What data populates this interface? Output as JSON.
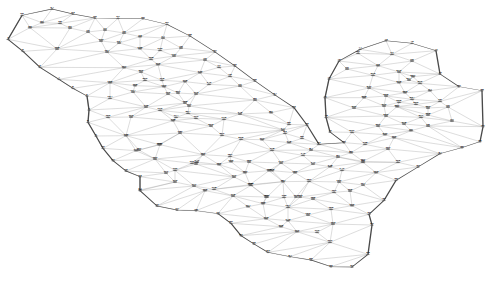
{
  "figure": {
    "name": "finite-element-mesh",
    "type": "triangulated-mesh-diagram",
    "title": "",
    "width": 492,
    "height": 282,
    "background_color": "#ffffff",
    "edge_color": "#8c8c8c",
    "boundary_color": "#4a4a4a",
    "node_color": "#6b6b6b",
    "label_color": "#1a1a1a",
    "node_count": 231
  },
  "chart_data": {
    "type": "scatter",
    "title": "",
    "xlabel": "",
    "ylabel": "",
    "grid": false,
    "legend": false,
    "xlim": [
      0,
      492
    ],
    "ylim": [
      0,
      282
    ]
  },
  "nodes": [
    {
      "id": "1",
      "x": 8,
      "y": 118,
      "b": 1
    },
    {
      "id": "2",
      "x": 23,
      "y": 154,
      "b": 1
    },
    {
      "id": "3",
      "x": 40,
      "y": 202,
      "b": 1
    },
    {
      "id": "4",
      "x": 59,
      "y": 238,
      "b": 1
    },
    {
      "id": "5",
      "x": 73,
      "y": 265,
      "b": 1
    },
    {
      "id": "6",
      "x": 87,
      "y": 288,
      "b": 1
    },
    {
      "id": "7",
      "x": 89,
      "y": 330,
      "b": 1
    },
    {
      "id": "8",
      "x": 88,
      "y": 367,
      "b": 1
    },
    {
      "id": "9",
      "x": 96,
      "y": 408,
      "b": 1
    },
    {
      "id": "10",
      "x": 103,
      "y": 445,
      "b": 1
    },
    {
      "id": "11",
      "x": 113,
      "y": 482,
      "b": 1
    },
    {
      "id": "12",
      "x": 126,
      "y": 513,
      "b": 1
    },
    {
      "id": "13",
      "x": 140,
      "y": 530,
      "b": 1
    },
    {
      "id": "14",
      "x": 140,
      "y": 570,
      "b": 1
    },
    {
      "id": "15",
      "x": 140,
      "y": 572,
      "b": 1
    },
    {
      "id": "16",
      "x": 157,
      "y": 618,
      "b": 1
    },
    {
      "id": "17",
      "x": 177,
      "y": 630,
      "b": 1
    },
    {
      "id": "18",
      "x": 196,
      "y": 632,
      "b": 1
    },
    {
      "id": "19",
      "x": 218,
      "y": 641,
      "b": 1
    },
    {
      "id": "20",
      "x": 231,
      "y": 670,
      "b": 1
    },
    {
      "id": "21",
      "x": 241,
      "y": 707,
      "b": 1
    },
    {
      "id": "22",
      "x": 254,
      "y": 732,
      "b": 1
    },
    {
      "id": "23",
      "x": 268,
      "y": 757,
      "b": 1
    },
    {
      "id": "24",
      "x": 290,
      "y": 770,
      "b": 1
    },
    {
      "id": "25",
      "x": 311,
      "y": 780,
      "b": 1
    },
    {
      "id": "26",
      "x": 331,
      "y": 800,
      "b": 1
    },
    {
      "id": "27",
      "x": 352,
      "y": 801,
      "b": 1
    },
    {
      "id": "28",
      "x": 368,
      "y": 763,
      "b": 1
    },
    {
      "id": "29",
      "x": 372,
      "y": 675,
      "b": 1
    },
    {
      "id": "30",
      "x": 369,
      "y": 643,
      "b": 1
    },
    {
      "id": "31",
      "x": 384,
      "y": 601,
      "b": 1
    },
    {
      "id": "32",
      "x": 396,
      "y": 541,
      "b": 1
    },
    {
      "id": "33",
      "x": 418,
      "y": 501,
      "b": 1
    },
    {
      "id": "34",
      "x": 440,
      "y": 461,
      "b": 1
    },
    {
      "id": "35",
      "x": 462,
      "y": 443,
      "b": 1
    },
    {
      "id": "36",
      "x": 480,
      "y": 425,
      "b": 1
    },
    {
      "id": "37",
      "x": 483,
      "y": 380,
      "b": 1
    },
    {
      "id": "38",
      "x": 482,
      "y": 272,
      "b": 1
    },
    {
      "id": "39",
      "x": 459,
      "y": 260,
      "b": 1
    },
    {
      "id": "40",
      "x": 440,
      "y": 222,
      "b": 1
    },
    {
      "id": "41",
      "x": 436,
      "y": 152,
      "b": 1
    },
    {
      "id": "42",
      "x": 412,
      "y": 130,
      "b": 1
    },
    {
      "id": "43",
      "x": 386,
      "y": 122,
      "b": 1
    },
    {
      "id": "44",
      "x": 360,
      "y": 148,
      "b": 1
    },
    {
      "id": "45",
      "x": 339,
      "y": 183,
      "b": 1
    },
    {
      "id": "46",
      "x": 329,
      "y": 237,
      "b": 1
    },
    {
      "id": "47",
      "x": 325,
      "y": 293,
      "b": 1
    },
    {
      "id": "48",
      "x": 326,
      "y": 352,
      "b": 1
    },
    {
      "id": "49",
      "x": 330,
      "y": 396,
      "b": 1
    },
    {
      "id": "50",
      "x": 344,
      "y": 428,
      "b": 1
    },
    {
      "id": "51",
      "x": 319,
      "y": 433,
      "b": 0
    },
    {
      "id": "52",
      "x": 307,
      "y": 375,
      "b": 1
    },
    {
      "id": "53",
      "x": 294,
      "y": 323,
      "b": 1
    },
    {
      "id": "54",
      "x": 275,
      "y": 285,
      "b": 1
    },
    {
      "id": "55",
      "x": 255,
      "y": 243,
      "b": 1
    },
    {
      "id": "56",
      "x": 235,
      "y": 198,
      "b": 1
    },
    {
      "id": "57",
      "x": 215,
      "y": 156,
      "b": 1
    },
    {
      "id": "58",
      "x": 190,
      "y": 108,
      "b": 1
    },
    {
      "id": "59",
      "x": 167,
      "y": 73,
      "b": 1
    },
    {
      "id": "60",
      "x": 143,
      "y": 56,
      "b": 1
    },
    {
      "id": "61",
      "x": 118,
      "y": 55,
      "b": 1
    },
    {
      "id": "62",
      "x": 95,
      "y": 54,
      "b": 1
    },
    {
      "id": "63",
      "x": 73,
      "y": 42,
      "b": 1
    },
    {
      "id": "64",
      "x": 52,
      "y": 27,
      "b": 1
    },
    {
      "id": "65",
      "x": 22,
      "y": 46,
      "b": 1
    },
    {
      "id": "66",
      "x": 30,
      "y": 83,
      "b": 0
    },
    {
      "id": "67",
      "x": 42,
      "y": 68,
      "b": 0
    },
    {
      "id": "68",
      "x": 60,
      "y": 70,
      "b": 0
    },
    {
      "id": "69",
      "x": 70,
      "y": 84,
      "b": 0
    },
    {
      "id": "70",
      "x": 88,
      "y": 96,
      "b": 0
    },
    {
      "id": "71",
      "x": 105,
      "y": 90,
      "b": 0
    },
    {
      "id": "72",
      "x": 124,
      "y": 99,
      "b": 0
    },
    {
      "id": "73",
      "x": 140,
      "y": 110,
      "b": 0
    },
    {
      "id": "74",
      "x": 163,
      "y": 114,
      "b": 0
    },
    {
      "id": "75",
      "x": 181,
      "y": 144,
      "b": 0
    },
    {
      "id": "76",
      "x": 205,
      "y": 180,
      "b": 0
    },
    {
      "id": "77",
      "x": 219,
      "y": 202,
      "b": 0
    },
    {
      "id": "78",
      "x": 230,
      "y": 229,
      "b": 0
    },
    {
      "id": "79",
      "x": 240,
      "y": 258,
      "b": 0
    },
    {
      "id": "80",
      "x": 255,
      "y": 300,
      "b": 0
    },
    {
      "id": "81",
      "x": 271,
      "y": 338,
      "b": 0
    },
    {
      "id": "82",
      "x": 289,
      "y": 373,
      "b": 0
    },
    {
      "id": "83",
      "x": 285,
      "y": 400,
      "b": 0
    },
    {
      "id": "84",
      "x": 311,
      "y": 450,
      "b": 0
    },
    {
      "id": "85",
      "x": 302,
      "y": 415,
      "b": 0
    },
    {
      "id": "86",
      "x": 351,
      "y": 458,
      "b": 0
    },
    {
      "id": "87",
      "x": 338,
      "y": 471,
      "b": 0
    },
    {
      "id": "88",
      "x": 363,
      "y": 487,
      "b": 0
    },
    {
      "id": "89",
      "x": 358,
      "y": 160,
      "b": 0
    },
    {
      "id": "90",
      "x": 347,
      "y": 207,
      "b": 0
    },
    {
      "id": "91",
      "x": 392,
      "y": 163,
      "b": 0
    },
    {
      "id": "92",
      "x": 412,
      "y": 183,
      "b": 0
    },
    {
      "id": "93",
      "x": 378,
      "y": 197,
      "b": 0
    },
    {
      "id": "94",
      "x": 430,
      "y": 272,
      "b": 0
    },
    {
      "id": "95",
      "x": 440,
      "y": 304,
      "b": 0
    },
    {
      "id": "96",
      "x": 448,
      "y": 321,
      "b": 0
    },
    {
      "id": "97",
      "x": 452,
      "y": 363,
      "b": 0
    },
    {
      "id": "98",
      "x": 428,
      "y": 378,
      "b": 0
    },
    {
      "id": "99",
      "x": 411,
      "y": 392,
      "b": 0
    },
    {
      "id": "100",
      "x": 394,
      "y": 413,
      "b": 0
    },
    {
      "id": "101",
      "x": 388,
      "y": 447,
      "b": 0
    },
    {
      "id": "102",
      "x": 398,
      "y": 487,
      "b": 0
    },
    {
      "id": "103",
      "x": 376,
      "y": 518,
      "b": 0
    },
    {
      "id": "104",
      "x": 363,
      "y": 555,
      "b": 0
    },
    {
      "id": "105",
      "x": 350,
      "y": 573,
      "b": 0
    },
    {
      "id": "106",
      "x": 352,
      "y": 617,
      "b": 0
    },
    {
      "id": "107",
      "x": 363,
      "y": 484,
      "b": 0
    },
    {
      "id": "108",
      "x": 365,
      "y": 433,
      "b": 0
    },
    {
      "id": "109",
      "x": 330,
      "y": 727,
      "b": 0
    },
    {
      "id": "110",
      "x": 317,
      "y": 697,
      "b": 0
    },
    {
      "id": "111",
      "x": 297,
      "y": 695,
      "b": 0
    },
    {
      "id": "112",
      "x": 281,
      "y": 680,
      "b": 0
    },
    {
      "id": "113",
      "x": 266,
      "y": 656,
      "b": 0
    },
    {
      "id": "114",
      "x": 248,
      "y": 620,
      "b": 0
    },
    {
      "id": "115",
      "x": 233,
      "y": 588,
      "b": 0
    },
    {
      "id": "116",
      "x": 175,
      "y": 546,
      "b": 0
    },
    {
      "id": "117",
      "x": 194,
      "y": 558,
      "b": 0
    },
    {
      "id": "118",
      "x": 214,
      "y": 568,
      "b": 0
    },
    {
      "id": "119",
      "x": 234,
      "y": 531,
      "b": 0
    },
    {
      "id": "120",
      "x": 219,
      "y": 494,
      "b": 0
    },
    {
      "id": "121",
      "x": 203,
      "y": 464,
      "b": 0
    },
    {
      "id": "122",
      "x": 126,
      "y": 407,
      "b": 0
    },
    {
      "id": "123",
      "x": 333,
      "y": 672,
      "b": 0
    },
    {
      "id": "124",
      "x": 110,
      "y": 295,
      "b": 0
    },
    {
      "id": "125",
      "x": 110,
      "y": 248,
      "b": 0
    },
    {
      "id": "126",
      "x": 108,
      "y": 352,
      "b": 0
    },
    {
      "id": "127",
      "x": 139,
      "y": 450,
      "b": 0
    },
    {
      "id": "128",
      "x": 57,
      "y": 147,
      "b": 0
    },
    {
      "id": "129",
      "x": 155,
      "y": 477,
      "b": 0
    },
    {
      "id": "130",
      "x": 175,
      "y": 511,
      "b": 0
    },
    {
      "id": "131",
      "x": 192,
      "y": 490,
      "b": 0
    },
    {
      "id": "132",
      "x": 160,
      "y": 434,
      "b": 0
    },
    {
      "id": "133",
      "x": 101,
      "y": 123,
      "b": 0
    },
    {
      "id": "134",
      "x": 119,
      "y": 129,
      "b": 0
    },
    {
      "id": "135",
      "x": 140,
      "y": 146,
      "b": 0
    },
    {
      "id": "136",
      "x": 160,
      "y": 151,
      "b": 0
    },
    {
      "id": "137",
      "x": 174,
      "y": 168,
      "b": 0
    },
    {
      "id": "138",
      "x": 251,
      "y": 556,
      "b": 0
    },
    {
      "id": "139",
      "x": 267,
      "y": 591,
      "b": 0
    },
    {
      "id": "140",
      "x": 209,
      "y": 253,
      "b": 0
    },
    {
      "id": "141",
      "x": 197,
      "y": 486,
      "b": 0
    },
    {
      "id": "142",
      "x": 240,
      "y": 342,
      "b": 0
    },
    {
      "id": "143",
      "x": 288,
      "y": 662,
      "b": 0
    },
    {
      "id": "144",
      "x": 283,
      "y": 390,
      "b": 0
    },
    {
      "id": "145",
      "x": 289,
      "y": 428,
      "b": 0
    },
    {
      "id": "146",
      "x": 303,
      "y": 466,
      "b": 0
    },
    {
      "id": "147",
      "x": 313,
      "y": 492,
      "b": 0
    },
    {
      "id": "148",
      "x": 330,
      "y": 500,
      "b": 0
    },
    {
      "id": "149",
      "x": 342,
      "y": 511,
      "b": 0
    },
    {
      "id": "150",
      "x": 339,
      "y": 546,
      "b": 0
    },
    {
      "id": "151",
      "x": 334,
      "y": 577,
      "b": 0
    },
    {
      "id": "152",
      "x": 331,
      "y": 628,
      "b": 0
    },
    {
      "id": "153",
      "x": 308,
      "y": 645,
      "b": 0
    },
    {
      "id": "154",
      "x": 288,
      "y": 622,
      "b": 0
    },
    {
      "id": "155",
      "x": 263,
      "y": 611,
      "b": 0
    },
    {
      "id": "156",
      "x": 284,
      "y": 592,
      "b": 0
    },
    {
      "id": "157",
      "x": 266,
      "y": 591,
      "b": 0
    },
    {
      "id": "158",
      "x": 250,
      "y": 554,
      "b": 0
    },
    {
      "id": "159",
      "x": 245,
      "y": 518,
      "b": 0
    },
    {
      "id": "160",
      "x": 231,
      "y": 485,
      "b": 0
    },
    {
      "id": "161",
      "x": 196,
      "y": 492,
      "b": 0
    },
    {
      "id": "162",
      "x": 205,
      "y": 572,
      "b": 0
    },
    {
      "id": "163",
      "x": 296,
      "y": 591,
      "b": 0
    },
    {
      "id": "164",
      "x": 107,
      "y": 156,
      "b": 0
    },
    {
      "id": "165",
      "x": 135,
      "y": 257,
      "b": 0
    },
    {
      "id": "166",
      "x": 159,
      "y": 434,
      "b": 0
    },
    {
      "id": "167",
      "x": 124,
      "y": 203,
      "b": 0
    },
    {
      "id": "168",
      "x": 151,
      "y": 178,
      "b": 0
    },
    {
      "id": "169",
      "x": 164,
      "y": 260,
      "b": 0
    },
    {
      "id": "170",
      "x": 158,
      "y": 194,
      "b": 0
    },
    {
      "id": "171",
      "x": 136,
      "y": 452,
      "b": 0
    },
    {
      "id": "172",
      "x": 185,
      "y": 245,
      "b": 0
    },
    {
      "id": "173",
      "x": 196,
      "y": 282,
      "b": 0
    },
    {
      "id": "174",
      "x": 176,
      "y": 352,
      "b": 0
    },
    {
      "id": "175",
      "x": 224,
      "y": 358,
      "b": 0
    },
    {
      "id": "176",
      "x": 200,
      "y": 218,
      "b": 0
    },
    {
      "id": "177",
      "x": 262,
      "y": 419,
      "b": 0
    },
    {
      "id": "178",
      "x": 272,
      "y": 451,
      "b": 0
    },
    {
      "id": "179",
      "x": 281,
      "y": 489,
      "b": 0
    },
    {
      "id": "180",
      "x": 295,
      "y": 518,
      "b": 0
    },
    {
      "id": "181",
      "x": 309,
      "y": 544,
      "b": 0
    },
    {
      "id": "182",
      "x": 313,
      "y": 597,
      "b": 0
    },
    {
      "id": "183",
      "x": 300,
      "y": 591,
      "b": 0
    },
    {
      "id": "184",
      "x": 283,
      "y": 545,
      "b": 0
    },
    {
      "id": "185",
      "x": 269,
      "y": 512,
      "b": 0
    },
    {
      "id": "186",
      "x": 249,
      "y": 486,
      "b": 0
    },
    {
      "id": "187",
      "x": 230,
      "y": 469,
      "b": 0
    },
    {
      "id": "188",
      "x": 185,
      "y": 309,
      "b": 0
    },
    {
      "id": "189",
      "x": 180,
      "y": 399,
      "b": 0
    },
    {
      "id": "190",
      "x": 168,
      "y": 282,
      "b": 0
    },
    {
      "id": "191",
      "x": 166,
      "y": 519,
      "b": 0
    },
    {
      "id": "192",
      "x": 146,
      "y": 321,
      "b": 0
    },
    {
      "id": "193",
      "x": 131,
      "y": 351,
      "b": 0
    },
    {
      "id": "194",
      "x": 133,
      "y": 276,
      "b": 0
    },
    {
      "id": "195",
      "x": 162,
      "y": 241,
      "b": 0
    },
    {
      "id": "196",
      "x": 160,
      "y": 331,
      "b": 0
    },
    {
      "id": "197",
      "x": 189,
      "y": 318,
      "b": 0
    },
    {
      "id": "198",
      "x": 173,
      "y": 362,
      "b": 0
    },
    {
      "id": "199",
      "x": 196,
      "y": 355,
      "b": 0
    },
    {
      "id": "200",
      "x": 145,
      "y": 241,
      "b": 0
    },
    {
      "id": "201",
      "x": 222,
      "y": 406,
      "b": 0
    },
    {
      "id": "202",
      "x": 241,
      "y": 418,
      "b": 0
    },
    {
      "id": "203",
      "x": 211,
      "y": 378,
      "b": 0
    },
    {
      "id": "204",
      "x": 188,
      "y": 340,
      "b": 0
    },
    {
      "id": "205",
      "x": 272,
      "y": 512,
      "b": 0
    },
    {
      "id": "206",
      "x": 141,
      "y": 216,
      "b": 0
    },
    {
      "id": "207",
      "x": 178,
      "y": 279,
      "b": 0
    },
    {
      "id": "208",
      "x": 364,
      "y": 293,
      "b": 0
    },
    {
      "id": "209",
      "x": 378,
      "y": 378,
      "b": 0
    },
    {
      "id": "210",
      "x": 384,
      "y": 318,
      "b": 0
    },
    {
      "id": "211",
      "x": 369,
      "y": 264,
      "b": 0
    },
    {
      "id": "212",
      "x": 373,
      "y": 226,
      "b": 0
    },
    {
      "id": "213",
      "x": 399,
      "y": 216,
      "b": 0
    },
    {
      "id": "214",
      "x": 409,
      "y": 240,
      "b": 0
    },
    {
      "id": "215",
      "x": 399,
      "y": 248,
      "b": 0
    },
    {
      "id": "216",
      "x": 420,
      "y": 250,
      "b": 0
    },
    {
      "id": "217",
      "x": 421,
      "y": 352,
      "b": 0
    },
    {
      "id": "218",
      "x": 404,
      "y": 372,
      "b": 0
    },
    {
      "id": "219",
      "x": 385,
      "y": 404,
      "b": 0
    },
    {
      "id": "220",
      "x": 386,
      "y": 348,
      "b": 0
    },
    {
      "id": "221",
      "x": 397,
      "y": 320,
      "b": 0
    },
    {
      "id": "222",
      "x": 386,
      "y": 288,
      "b": 0
    },
    {
      "id": "223",
      "x": 405,
      "y": 278,
      "b": 0
    },
    {
      "id": "224",
      "x": 412,
      "y": 298,
      "b": 0
    },
    {
      "id": "225",
      "x": 399,
      "y": 307,
      "b": 0
    },
    {
      "id": "226",
      "x": 416,
      "y": 313,
      "b": 0
    },
    {
      "id": "227",
      "x": 413,
      "y": 230,
      "b": 0
    },
    {
      "id": "228",
      "x": 428,
      "y": 345,
      "b": 0
    },
    {
      "id": "229",
      "x": 428,
      "y": 324,
      "b": 0
    },
    {
      "id": "230",
      "x": 354,
      "y": 324,
      "b": 0
    },
    {
      "id": "231",
      "x": 352,
      "y": 397,
      "b": 0
    }
  ],
  "boundary_loop": [
    "1",
    "2",
    "3",
    "4",
    "5",
    "6",
    "7",
    "8",
    "9",
    "10",
    "11",
    "12",
    "13",
    "14",
    "15",
    "16",
    "17",
    "18",
    "19",
    "20",
    "21",
    "22",
    "23",
    "24",
    "25",
    "26",
    "27",
    "28",
    "29",
    "30",
    "31",
    "32",
    "33",
    "34",
    "35",
    "36",
    "37",
    "38",
    "39",
    "40",
    "41",
    "42",
    "43",
    "44",
    "45",
    "46",
    "47",
    "48",
    "49",
    "50",
    "51",
    "52",
    "53",
    "54",
    "55",
    "56",
    "57",
    "58",
    "59",
    "60",
    "61",
    "62",
    "63",
    "64",
    "65"
  ],
  "notch_nodes": [
    "46",
    "47",
    "48",
    "49",
    "50",
    "51",
    "52"
  ],
  "legend": [],
  "annotations": []
}
